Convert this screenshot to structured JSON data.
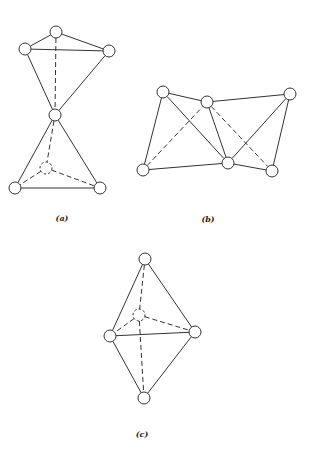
{
  "figure": {
    "node_radius": 6,
    "colors": {
      "stroke": "#333333",
      "fill": "#ffffff",
      "background": "#ffffff"
    },
    "panels": [
      {
        "id": "a",
        "label": "(a)",
        "label_pos": [
          62,
          221
        ],
        "description": "Two tetrahedra sharing a single vertex (bowtie / corner-sharing)",
        "nodes": [
          {
            "id": "a_top",
            "x": 56,
            "y": 32,
            "hidden": false
          },
          {
            "id": "a_left",
            "x": 25,
            "y": 49,
            "hidden": false
          },
          {
            "id": "a_right",
            "x": 109,
            "y": 51,
            "hidden": false
          },
          {
            "id": "a_mid",
            "x": 55,
            "y": 115,
            "hidden": false
          },
          {
            "id": "a_inner",
            "x": 46,
            "y": 168,
            "hidden": true
          },
          {
            "id": "a_bl",
            "x": 15,
            "y": 188,
            "hidden": false
          },
          {
            "id": "a_br",
            "x": 100,
            "y": 188,
            "hidden": false
          }
        ],
        "edges": [
          {
            "from": "a_top",
            "to": "a_left",
            "dashed": false
          },
          {
            "from": "a_top",
            "to": "a_right",
            "dashed": false
          },
          {
            "from": "a_left",
            "to": "a_right",
            "dashed": false
          },
          {
            "from": "a_left",
            "to": "a_mid",
            "dashed": false
          },
          {
            "from": "a_right",
            "to": "a_mid",
            "dashed": false
          },
          {
            "from": "a_top",
            "to": "a_mid",
            "dashed": true
          },
          {
            "from": "a_mid",
            "to": "a_bl",
            "dashed": false
          },
          {
            "from": "a_mid",
            "to": "a_br",
            "dashed": false
          },
          {
            "from": "a_bl",
            "to": "a_br",
            "dashed": false
          },
          {
            "from": "a_mid",
            "to": "a_inner",
            "dashed": true
          },
          {
            "from": "a_inner",
            "to": "a_bl",
            "dashed": true
          },
          {
            "from": "a_inner",
            "to": "a_br",
            "dashed": true
          }
        ]
      },
      {
        "id": "b",
        "label": "(b)",
        "label_pos": [
          208,
          222
        ],
        "description": "Edge-sharing tetrahedra chain",
        "nodes": [
          {
            "id": "b_tl",
            "x": 163,
            "y": 92,
            "hidden": false
          },
          {
            "id": "b_tm",
            "x": 207,
            "y": 102,
            "hidden": false
          },
          {
            "id": "b_tr",
            "x": 290,
            "y": 94,
            "hidden": false
          },
          {
            "id": "b_bl",
            "x": 143,
            "y": 170,
            "hidden": false
          },
          {
            "id": "b_bm",
            "x": 228,
            "y": 163,
            "hidden": false
          },
          {
            "id": "b_br",
            "x": 272,
            "y": 171,
            "hidden": false
          }
        ],
        "edges": [
          {
            "from": "b_tl",
            "to": "b_tm",
            "dashed": false
          },
          {
            "from": "b_tm",
            "to": "b_tr",
            "dashed": false
          },
          {
            "from": "b_tl",
            "to": "b_bl",
            "dashed": false
          },
          {
            "from": "b_tl",
            "to": "b_bm",
            "dashed": false
          },
          {
            "from": "b_tm",
            "to": "b_bm",
            "dashed": false
          },
          {
            "from": "b_bl",
            "to": "b_bm",
            "dashed": false
          },
          {
            "from": "b_bm",
            "to": "b_br",
            "dashed": false
          },
          {
            "from": "b_tr",
            "to": "b_br",
            "dashed": false
          },
          {
            "from": "b_bm",
            "to": "b_tr",
            "dashed": false
          },
          {
            "from": "b_bl",
            "to": "b_tm",
            "dashed": true
          },
          {
            "from": "b_tm",
            "to": "b_br",
            "dashed": true
          }
        ]
      },
      {
        "id": "c",
        "label": "(c)",
        "label_pos": [
          142,
          437
        ],
        "description": "Two tetrahedra sharing a face (trigonal bipyramid)",
        "nodes": [
          {
            "id": "c_top",
            "x": 145,
            "y": 259,
            "hidden": false
          },
          {
            "id": "c_inner",
            "x": 139,
            "y": 315,
            "hidden": true
          },
          {
            "id": "c_left",
            "x": 110,
            "y": 336,
            "hidden": false
          },
          {
            "id": "c_right",
            "x": 195,
            "y": 332,
            "hidden": false
          },
          {
            "id": "c_bottom",
            "x": 144,
            "y": 398,
            "hidden": false
          }
        ],
        "edges": [
          {
            "from": "c_top",
            "to": "c_left",
            "dashed": false
          },
          {
            "from": "c_top",
            "to": "c_right",
            "dashed": false
          },
          {
            "from": "c_left",
            "to": "c_right",
            "dashed": false
          },
          {
            "from": "c_left",
            "to": "c_bottom",
            "dashed": false
          },
          {
            "from": "c_right",
            "to": "c_bottom",
            "dashed": false
          },
          {
            "from": "c_top",
            "to": "c_inner",
            "dashed": true
          },
          {
            "from": "c_inner",
            "to": "c_left",
            "dashed": true
          },
          {
            "from": "c_inner",
            "to": "c_right",
            "dashed": true
          },
          {
            "from": "c_inner",
            "to": "c_bottom",
            "dashed": true
          }
        ]
      }
    ]
  }
}
